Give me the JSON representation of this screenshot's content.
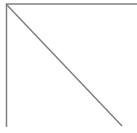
{
  "figure": {
    "name": "right-triangle-outline",
    "title": "Right triangle line drawing",
    "description": "Open right triangle outline: top horizontal edge, left vertical edge, and a diagonal hypotenuse from top-left to bottom-right. Bottom and right sides are not drawn.",
    "canvas": {
      "width": 137,
      "height": 133,
      "background_color": "#ffffff"
    },
    "stroke": {
      "color": "#808080",
      "width": 1.5,
      "linecap": "butt"
    },
    "segments": [
      {
        "name": "top-edge",
        "label": "Top horizontal edge",
        "x1": 6,
        "y1": 4,
        "x2": 137,
        "y2": 4,
        "orientation": "horizontal"
      },
      {
        "name": "left-edge",
        "label": "Left vertical edge",
        "x1": 6.5,
        "y1": 4,
        "x2": 6.5,
        "y2": 127,
        "orientation": "vertical"
      },
      {
        "name": "hypotenuse",
        "label": "Diagonal hypotenuse",
        "x1": 6,
        "y1": 4,
        "x2": 122,
        "y2": 126,
        "orientation": "diagonal"
      }
    ]
  }
}
